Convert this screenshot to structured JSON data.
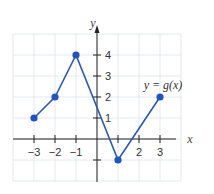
{
  "chart_data": {
    "type": "line",
    "title": "",
    "xlabel": "x",
    "ylabel": "y",
    "function_label": "y = g(x)",
    "points": [
      {
        "x": -3,
        "y": 1
      },
      {
        "x": -2,
        "y": 2
      },
      {
        "x": -1,
        "y": 4
      },
      {
        "x": 1,
        "y": -1
      },
      {
        "x": 3,
        "y": 2
      }
    ],
    "x_ticks": [
      -3,
      -2,
      -1,
      1,
      2,
      3
    ],
    "x_tick_labels": [
      "−3",
      "−2",
      "−1",
      "2",
      "3"
    ],
    "y_ticks": [
      1,
      2,
      3,
      4,
      -1
    ],
    "y_tick_labels": [
      "1",
      "2",
      "3",
      "4"
    ],
    "xlim": [
      -4,
      4
    ],
    "ylim": [
      -2,
      5
    ],
    "grid": true,
    "colors": {
      "line": "#2a5ab8",
      "point": "#1f55c0",
      "axis": "#222222",
      "grid": "#dde3ea"
    }
  }
}
